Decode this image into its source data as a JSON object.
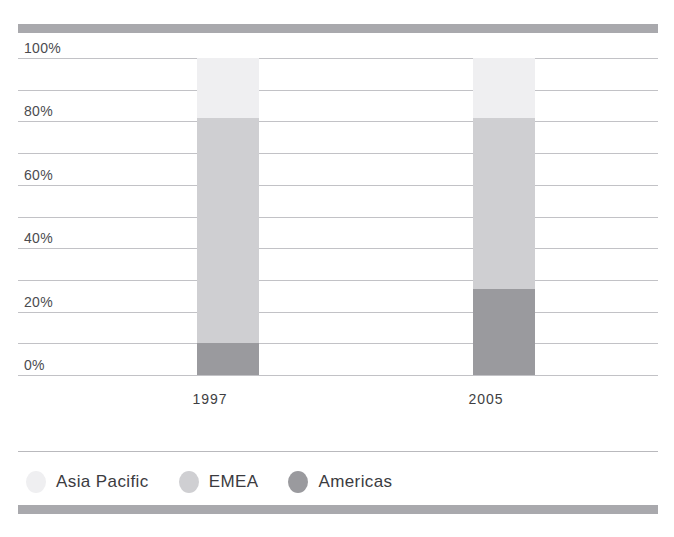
{
  "chart_data": {
    "type": "bar",
    "subtype": "stacked-bar-100pct",
    "title": "",
    "xlabel": "",
    "ylabel": "",
    "categories": [
      "1997",
      "2005"
    ],
    "series": [
      {
        "name": "Americas",
        "values": [
          10,
          27
        ],
        "color": "#9a9a9e"
      },
      {
        "name": "EMEA",
        "values": [
          71,
          54
        ],
        "color": "#cfcfd2"
      },
      {
        "name": "Asia Pacific",
        "values": [
          19,
          19
        ],
        "color": "#efeff1"
      }
    ],
    "stack_order_bottom_to_top": [
      "Americas",
      "EMEA",
      "Asia Pacific"
    ],
    "ylim": [
      0,
      100
    ],
    "ytick_values": [
      0,
      10,
      20,
      30,
      40,
      50,
      60,
      70,
      80,
      90,
      100
    ],
    "ytick_labels": [
      "0%",
      "",
      "20%",
      "",
      "40%",
      "",
      "60%",
      "",
      "80%",
      "",
      "100%"
    ],
    "grid": true,
    "grid_axis": "y",
    "legend_position": "bottom-left",
    "legend_order": [
      "Asia Pacific",
      "EMEA",
      "Americas"
    ]
  },
  "axis": {
    "y_labels": [
      {
        "value": 100,
        "text": "100%"
      },
      {
        "value": 80,
        "text": "80%"
      },
      {
        "value": 60,
        "text": "60%"
      },
      {
        "value": 40,
        "text": "40%"
      },
      {
        "value": 20,
        "text": "20%"
      },
      {
        "value": 0,
        "text": "0%"
      }
    ],
    "x_labels": [
      {
        "text": "1997"
      },
      {
        "text": "2005"
      }
    ]
  },
  "legend": {
    "items": [
      {
        "label": "Asia Pacific",
        "color": "#efeff1"
      },
      {
        "label": "EMEA",
        "color": "#cfcfd2"
      },
      {
        "label": "Americas",
        "color": "#9a9a9e"
      }
    ]
  },
  "decor": {
    "top_sliver_text": "",
    "rule_color": "#a9a9ad",
    "grid_color": "#c2c2c6",
    "background": "#ffffff"
  }
}
